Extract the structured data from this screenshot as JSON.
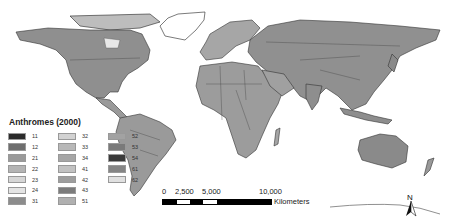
{
  "map": {
    "title": "Anthromes (2000)",
    "background_color": "#ffffff",
    "land_base_color": "#8a8a8a"
  },
  "legend": {
    "title": "Anthromes (2000)",
    "items": [
      {
        "code": "11",
        "color": "#2b2b2b"
      },
      {
        "code": "12",
        "color": "#6e6e6e"
      },
      {
        "code": "21",
        "color": "#9a9a9a"
      },
      {
        "code": "22",
        "color": "#b4b4b4"
      },
      {
        "code": "23",
        "color": "#d6d6d6"
      },
      {
        "code": "24",
        "color": "#e4e4e4"
      },
      {
        "code": "31",
        "color": "#8c8c8c"
      },
      {
        "code": "32",
        "color": "#d2d2d2"
      },
      {
        "code": "33",
        "color": "#b8b8b8"
      },
      {
        "code": "34",
        "color": "#a6a6a6"
      },
      {
        "code": "41",
        "color": "#c2c2c2"
      },
      {
        "code": "42",
        "color": "#9e9e9e"
      },
      {
        "code": "43",
        "color": "#7c7c7c"
      },
      {
        "code": "51",
        "color": "#b0b0b0"
      },
      {
        "code": "52",
        "color": "#a2a2a2"
      },
      {
        "code": "53",
        "color": "#7a7a7a"
      },
      {
        "code": "54",
        "color": "#3a3a3a"
      },
      {
        "code": "61",
        "color": "#858585"
      },
      {
        "code": "62",
        "color": "#e0e0e0"
      }
    ]
  },
  "scalebar": {
    "ticks": [
      "0",
      "2,500",
      "5,000",
      "10,000"
    ],
    "unit": "Kilometers"
  },
  "north_arrow": {
    "label": "N"
  }
}
